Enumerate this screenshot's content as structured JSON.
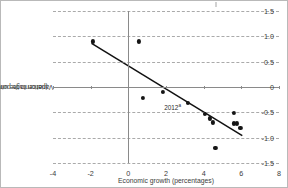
{
  "chart_data": {
    "type": "scatter",
    "title": "",
    "xlabel": "Economic growth (percentages)",
    "ylabel": "Variation in the unemployment rate (percentage points)",
    "xlim": [
      -4,
      8
    ],
    "ylim": [
      -1.5,
      1.5
    ],
    "xticks": [
      -4,
      -2,
      0,
      2,
      4,
      6,
      8
    ],
    "xticklabels": [
      "-4",
      "-2",
      "0",
      "2",
      "4",
      "6",
      "8"
    ],
    "yticks": [
      -1.5,
      -1.0,
      -0.5,
      0,
      0.5,
      1.0,
      1.5
    ],
    "yticklabels": [
      "-1.5",
      "-1.0",
      "-0.5",
      "0",
      "0.5",
      "1.0",
      "1.5"
    ],
    "grid": "horizontal-dashed",
    "legend": "none",
    "points": [
      {
        "x": -1.9,
        "y": 0.9
      },
      {
        "x": 0.55,
        "y": 0.9
      },
      {
        "x": 0.78,
        "y": -0.22
      },
      {
        "x": 1.85,
        "y": -0.1
      },
      {
        "x": 3.15,
        "y": -0.31
      },
      {
        "x": 4.05,
        "y": -0.53
      },
      {
        "x": 4.35,
        "y": -0.62
      },
      {
        "x": 4.5,
        "y": -0.7
      },
      {
        "x": 4.62,
        "y": -1.2
      },
      {
        "x": 5.6,
        "y": -0.51
      },
      {
        "x": 5.62,
        "y": -0.72
      },
      {
        "x": 5.78,
        "y": -0.72
      },
      {
        "x": 5.95,
        "y": -0.81
      }
    ],
    "trendline": {
      "x0": -1.95,
      "y0": 0.86,
      "x1": 6.05,
      "y1": -0.96
    },
    "annotations": [
      {
        "text": "2012",
        "superscript": "a",
        "x": 2.35,
        "y": -0.4
      }
    ]
  },
  "axes": {
    "x_title": "Economic growth (percentages)",
    "y_title_line1": "Variation in the unemployment rate",
    "y_title_line2": "(percentage points)"
  },
  "colors": {
    "point": "#151515",
    "trendline": "#111111",
    "gridline": "#8e8e8e",
    "axis": "#8a8a8a",
    "text": "#3b3b3b",
    "border": "#b9b9b9",
    "background": "#ffffff"
  }
}
